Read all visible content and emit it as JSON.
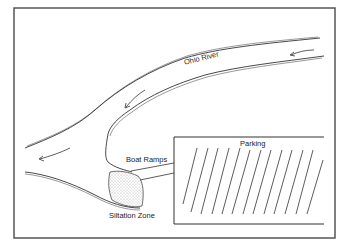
{
  "diagram": {
    "labels": {
      "river": "Ohio River",
      "parking": "Parking",
      "boat_ramps": "Boat Ramps",
      "siltation_zone": "Siltation Zone"
    },
    "flow_arrows": 3,
    "parking_stripes": 14,
    "colors": {
      "line": "#333333",
      "frame": "#555555",
      "background": "#ffffff"
    }
  }
}
